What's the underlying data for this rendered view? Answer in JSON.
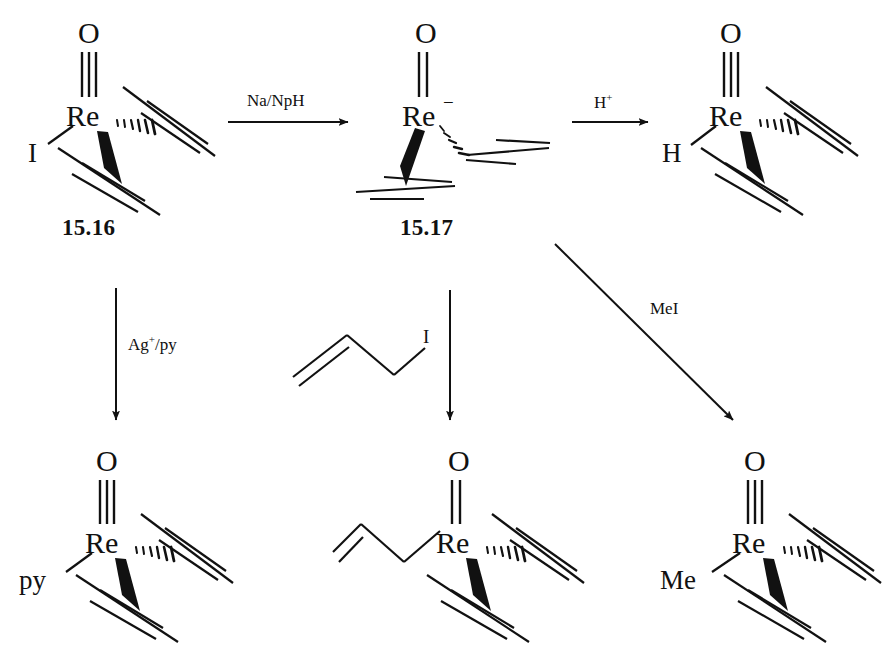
{
  "diagram": {
    "background_color": "#ffffff",
    "line_color": "#111111"
  },
  "compounds": [
    {
      "id": "compound-15-16",
      "label": "15.16",
      "center_atom": "Re",
      "oxo_label": "O",
      "oxo_bond": "triple",
      "substituent": "I",
      "charge": "",
      "alkyne_count": 2
    },
    {
      "id": "compound-15-17",
      "label": "15.17",
      "center_atom": "Re",
      "oxo_label": "O",
      "oxo_bond": "double",
      "substituent": "",
      "charge": "−",
      "alkyne_count": 2
    },
    {
      "id": "compound-hydride",
      "label": "",
      "center_atom": "Re",
      "oxo_label": "O",
      "oxo_bond": "triple",
      "substituent": "H",
      "charge": "",
      "alkyne_count": 2
    },
    {
      "id": "compound-pyridine",
      "label": "",
      "center_atom": "Re",
      "oxo_label": "O",
      "oxo_bond": "triple",
      "substituent": "py",
      "charge": "",
      "alkyne_count": 2
    },
    {
      "id": "compound-allyl",
      "label": "",
      "center_atom": "Re",
      "oxo_label": "O",
      "oxo_bond": "double",
      "substituent": "allyl-chain",
      "charge": "",
      "alkyne_count": 2
    },
    {
      "id": "compound-methyl",
      "label": "",
      "center_atom": "Re",
      "oxo_label": "O",
      "oxo_bond": "triple",
      "substituent": "Me",
      "charge": "",
      "alkyne_count": 2
    }
  ],
  "reagents": {
    "reduction": "Na/NpH",
    "protonation_base": "H",
    "protonation_sup": "+",
    "silver_py_base": "Ag",
    "silver_py_sup": "+",
    "silver_py_rest": "/py",
    "allyl_iodide_label": "I",
    "methyl_iodide": "MeI"
  },
  "atom_labels": {
    "oxo": "O",
    "metal": "Re",
    "iodide": "I",
    "hydride": "H",
    "pyridine": "py",
    "methyl": "Me",
    "anion_charge": "−"
  },
  "arrows": [
    {
      "name": "arrow-reduction",
      "direction": "right",
      "reagent": "Na/NpH"
    },
    {
      "name": "arrow-protonation",
      "direction": "right",
      "reagent": "H+"
    },
    {
      "name": "arrow-silver-pyridine",
      "direction": "down",
      "reagent": "Ag+/py"
    },
    {
      "name": "arrow-allylation",
      "direction": "down",
      "reagent": "allyl iodide"
    },
    {
      "name": "arrow-methylation",
      "direction": "diagonal-down-right",
      "reagent": "MeI"
    }
  ]
}
